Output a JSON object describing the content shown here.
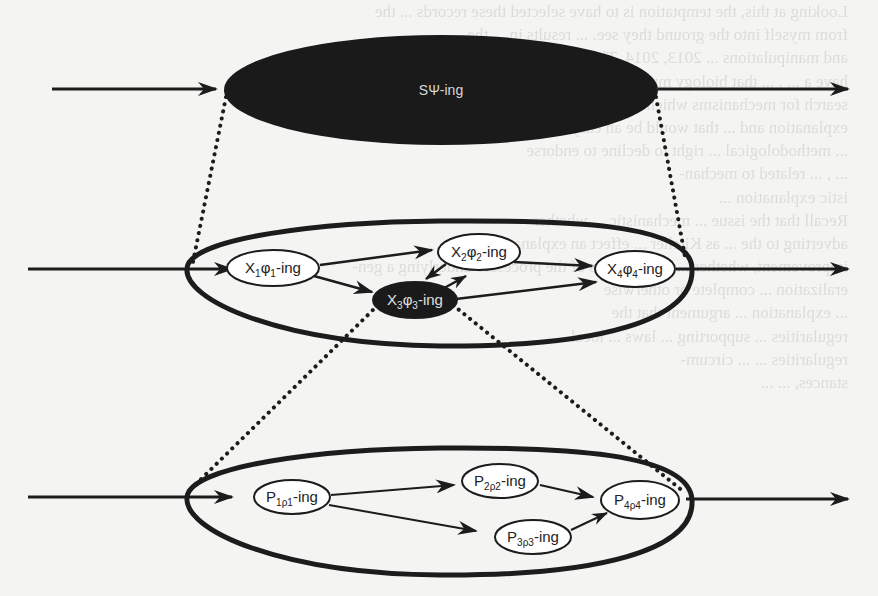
{
  "figure": {
    "type": "nested mechanism diagram",
    "top_level": {
      "label": "SΨ-ing",
      "label_parts": {
        "base": "SΨ",
        "suffix": "-ing"
      },
      "fill": "#1a1a1a"
    },
    "middle_level": {
      "nodes": [
        {
          "id": "x1",
          "base": "X",
          "sub1": "1",
          "mid": "φ",
          "sub2": "1",
          "suffix": "-ing",
          "filled": false
        },
        {
          "id": "x2",
          "base": "X",
          "sub1": "2",
          "mid": "φ",
          "sub2": "2",
          "suffix": "-ing",
          "filled": false
        },
        {
          "id": "x3",
          "base": "X",
          "sub1": "3",
          "mid": "φ",
          "sub2": "3",
          "suffix": "-ing",
          "filled": true
        },
        {
          "id": "x4",
          "base": "X",
          "sub1": "4",
          "mid": "φ",
          "sub2": "4",
          "suffix": "-ing",
          "filled": false
        }
      ],
      "edges": [
        [
          "in",
          "x1"
        ],
        [
          "x1",
          "x2"
        ],
        [
          "x1",
          "x3"
        ],
        [
          "x2",
          "x3"
        ],
        [
          "x3",
          "x2"
        ],
        [
          "x2",
          "x4"
        ],
        [
          "x3",
          "x4"
        ],
        [
          "x4",
          "out"
        ]
      ]
    },
    "bottom_level": {
      "nodes": [
        {
          "id": "p1",
          "base": "P",
          "sub": "1ρ1",
          "suffix": "-ing"
        },
        {
          "id": "p2",
          "base": "P",
          "sub": "2ρ2",
          "suffix": "-ing"
        },
        {
          "id": "p3",
          "base": "P",
          "sub": "3ρ3",
          "suffix": "-ing"
        },
        {
          "id": "p4",
          "base": "P",
          "sub": "4ρ4",
          "suffix": "-ing"
        }
      ],
      "edges": [
        [
          "in",
          "p1"
        ],
        [
          "p1",
          "p2"
        ],
        [
          "p1",
          "p3"
        ],
        [
          "p2",
          "p4"
        ],
        [
          "p3",
          "p4"
        ],
        [
          "p4",
          "out"
        ]
      ]
    },
    "zoom_connectors": "dotted lines linking the edges of each level to the ellipse of the level below",
    "colors": {
      "ink": "#1c1c1c",
      "paper": "#f4f4f2",
      "node_fill": "#ffffff",
      "filled_node": "#1a1a1a"
    }
  },
  "bleed_through_text": [
    "Looking at this, the temptation is to have selected these records ... the",
    "from myself into the ground they see. ... results in ... the",
    "and manipulations ... 2013, 2014. They",
    "have a ... . ... that biology must",
    "search for mechanisms which ... which mechanisms provide the right",
    "explanation and ... that would be an easy to defend ... ,but",
    "... methodological ... right to decline to endorse",
    "... , ... related to mechan-",
    "istic explanation ... ",
    "Recall that the issue ... mechanistic ... whether",
    "adverting to the ... as Kitcher ... effect an explanatory",
    "improvement, whether ... more details of the processes underlying a gen-",
    "eralization ... complete or otherwise",
    "... explanation ... argument that the",
    "regularities ... supporting ... laws ... local",
    "regularities ... ... circum-",
    "stances, ... ..."
  ]
}
